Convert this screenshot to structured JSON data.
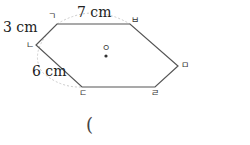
{
  "figure": {
    "shape": "hexagon",
    "vertices": [
      {
        "id": "g",
        "label": "ㄱ",
        "x": 57,
        "y": 24
      },
      {
        "id": "b",
        "label": "ㅂ",
        "x": 130,
        "y": 24
      },
      {
        "id": "m",
        "label": "ㅁ",
        "x": 178,
        "y": 66
      },
      {
        "id": "r",
        "label": "ㄹ",
        "x": 155,
        "y": 87
      },
      {
        "id": "d",
        "label": "ㄷ",
        "x": 82,
        "y": 87
      },
      {
        "id": "n",
        "label": "ㄴ",
        "x": 36,
        "y": 45
      }
    ],
    "center": {
      "label": "ㅇ",
      "x": 106,
      "y": 56
    },
    "measurements": {
      "top_edge": "7 cm",
      "upper_left_edge": "3 cm",
      "lower_left_edge": "6 cm"
    },
    "colors": {
      "edge": "#555555",
      "arc": "#cccccc",
      "text": "#222222"
    }
  },
  "answer": {
    "open_paren": "("
  }
}
